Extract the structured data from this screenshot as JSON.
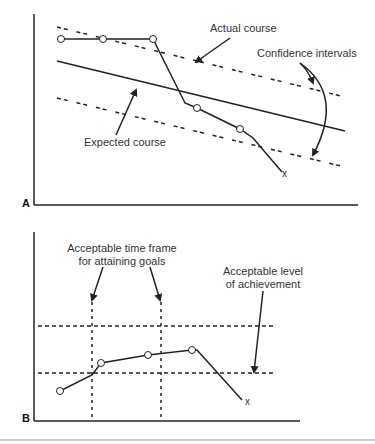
{
  "panel_a": {
    "letter": "A",
    "labels": {
      "actual": "Actual course",
      "confidence": "Confidence intervals",
      "expected": "Expected course",
      "end_marker": "x"
    },
    "actual_course_points": [
      [
        61,
        39
      ],
      [
        103,
        39
      ],
      [
        153,
        39
      ],
      [
        185,
        103
      ],
      [
        197,
        108
      ],
      [
        240,
        129
      ],
      [
        253,
        138
      ],
      [
        282,
        172
      ]
    ],
    "expected_course": [
      [
        57,
        61
      ],
      [
        345,
        131
      ]
    ],
    "upper_ci": [
      [
        57,
        27
      ],
      [
        345,
        97
      ]
    ],
    "lower_ci": [
      [
        57,
        98
      ],
      [
        345,
        167
      ]
    ]
  },
  "panel_b": {
    "letter": "B",
    "labels": {
      "time_frame_line1": "Acceptable time frame",
      "time_frame_line2": "for attaining goals",
      "level_line1": "Acceptable level",
      "level_line2": "of achievement",
      "end_marker": "x"
    },
    "actual_points": [
      [
        60,
        391
      ],
      [
        92,
        375
      ],
      [
        101,
        363
      ],
      [
        148,
        355
      ],
      [
        192,
        350
      ],
      [
        197,
        350
      ],
      [
        242,
        400
      ]
    ],
    "horizontal_levels_y": [
      326,
      373
    ],
    "vertical_times_x": [
      92,
      161
    ]
  },
  "colors": {
    "line": "#222222",
    "text": "#333333",
    "rule": "#999999"
  }
}
